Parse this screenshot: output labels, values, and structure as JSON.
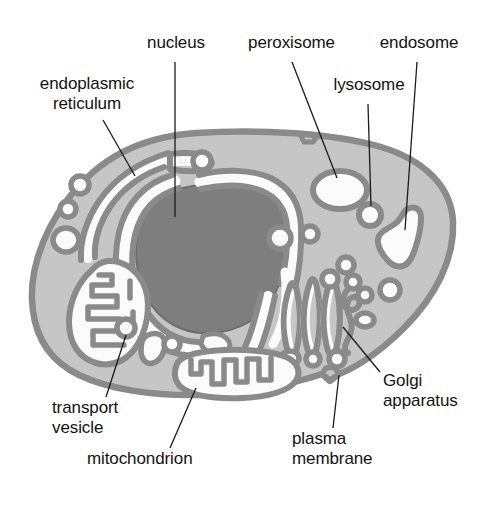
{
  "figure": {
    "type": "labeled-biological-diagram"
  },
  "colors": {
    "background": "#ffffff",
    "cytoplasm": "#c6c6c6",
    "membrane_outline": "#8a8a8a",
    "nucleus_fill": "#7e7e7e",
    "lumen_white": "#fbfbfb",
    "text": "#15120f",
    "leader_line": "#1b1b1b"
  },
  "labels": {
    "endoplasmic_reticulum": "endoplasmic\nreticulum",
    "nucleus": "nucleus",
    "peroxisome": "peroxisome",
    "lysosome": "lysosome",
    "endosome": "endosome",
    "golgi_apparatus": "Golgi\napparatus",
    "plasma_membrane": "plasma\nmembrane",
    "mitochondrion": "mitochondrion",
    "transport_vesicle": "transport\nvesicle"
  },
  "organelles": [
    {
      "name": "nucleus",
      "description": "large dark-gray nuclear body at cell center-left",
      "count": 1
    },
    {
      "name": "endoplasmic-reticulum",
      "description": "white membrane channels wrapping the nucleus and extending right",
      "count": 1
    },
    {
      "name": "peroxisome",
      "description": "large white oval vesicle upper right",
      "count": 1
    },
    {
      "name": "lysosome",
      "description": "small round vesicle right of peroxisome",
      "count": 1
    },
    {
      "name": "endosome",
      "description": "irregular white vesicle at far right",
      "count": 1
    },
    {
      "name": "golgi-apparatus",
      "description": "stack of curved flattened cisternae lower right with budding vesicles",
      "count": 1
    },
    {
      "name": "mitochondrion",
      "description": "oval organelle with folded cristae",
      "count": 2
    },
    {
      "name": "transport-vesicle",
      "description": "small round vesicles scattered in cytoplasm",
      "count": 12
    },
    {
      "name": "plasma-membrane",
      "description": "outer boundary of the cell with a small invagination at lower right",
      "count": 1
    }
  ]
}
